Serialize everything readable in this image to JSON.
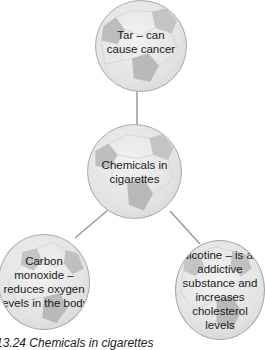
{
  "diagram": {
    "type": "mind-map",
    "center": {
      "label": "Chemicals in cigarettes"
    },
    "branches": [
      {
        "label": "Tar – can cause cancer"
      },
      {
        "label": "Carbon monoxide – reduces oxygen levels in the body"
      },
      {
        "label": "Nicotine – is an addictive substance and increases cholesterol levels"
      }
    ],
    "caption": "13.24 Chemicals in cigarettes"
  },
  "colors": {
    "ball_fill": "#e6e6e6",
    "ball_patch": "#bdbdbd",
    "link": "#9a9a9a",
    "text": "#1a1a1a"
  }
}
